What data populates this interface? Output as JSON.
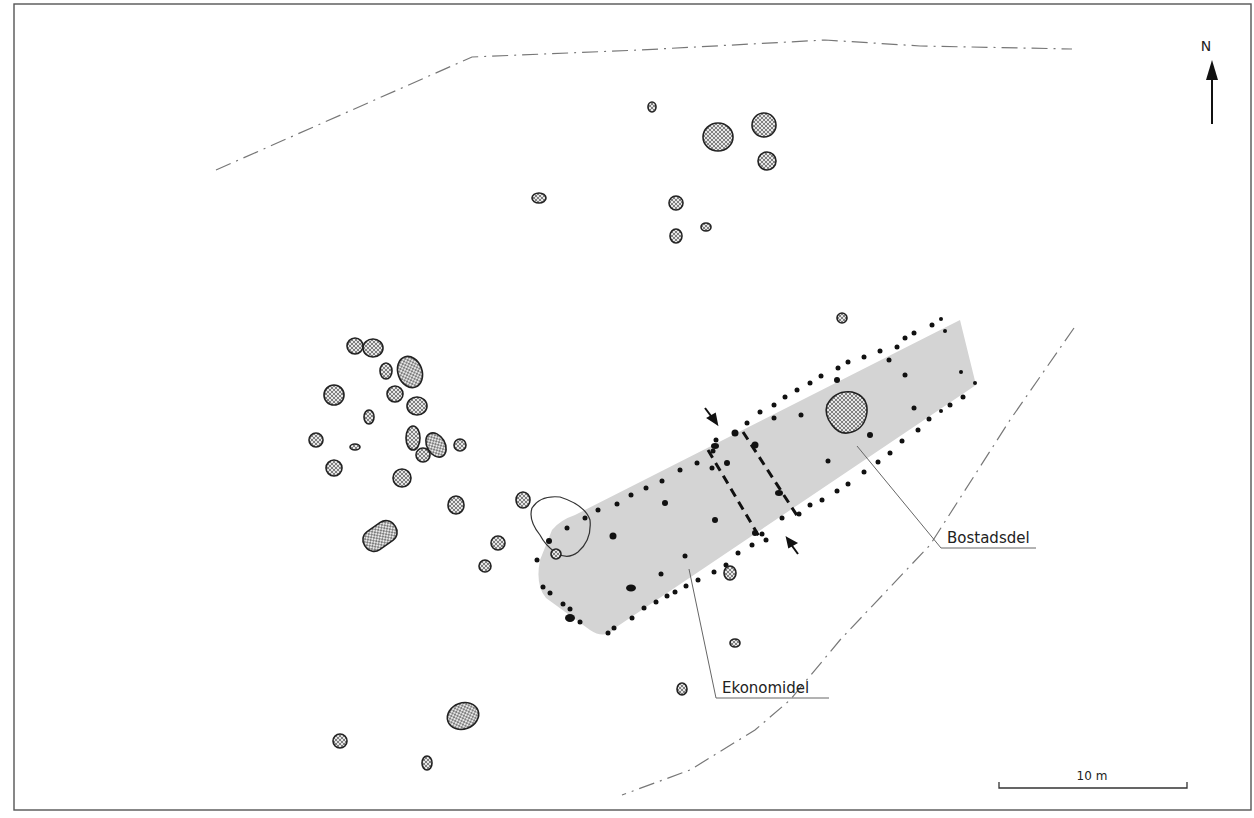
{
  "map": {
    "type": "archaeological site plan",
    "north_label": "N",
    "scale_bar": {
      "label": "10 m"
    },
    "labels": [
      {
        "id": "bostadsdel",
        "text": "Bostadsdel"
      },
      {
        "id": "ekonomidel",
        "text": "Ekonomidel"
      }
    ],
    "colors": {
      "house_fill": "#d4d4d4",
      "stone_stroke": "#222222",
      "post_fill": "#111111",
      "boundary_stroke": "#777777",
      "frame_stroke": "#555555"
    },
    "legend_features": {
      "stones": "cross-hatched ovals",
      "postholes": "black dots",
      "house": "grey shaded longhouse",
      "boundary": "dash-dot line",
      "partition": "dashed wall lines with arrows"
    }
  }
}
